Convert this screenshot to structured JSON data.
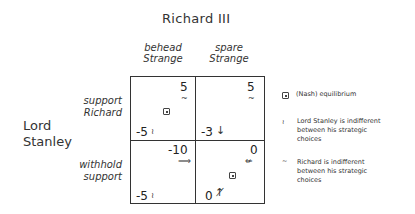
{
  "title": "Richard III",
  "column_player": "Richard III",
  "row_player": [
    "Lord",
    "Stanley"
  ],
  "columns": [
    {
      "line1": "behead",
      "line2": "Strange"
    },
    {
      "line1": "spare",
      "line2": "Strange"
    }
  ],
  "rows": [
    {
      "line1": "support",
      "line2": "Richard"
    },
    {
      "line1": "withhold",
      "line2": "support"
    }
  ],
  "cells": [
    [
      {
        "richard_payoff": "5",
        "richard_mark": "~",
        "stanley_payoff": "-5",
        "stanley_mark": "≀",
        "equilibrium": true
      },
      {
        "richard_payoff": "5",
        "richard_mark": "~",
        "stanley_payoff": "-3",
        "stanley_mark": "↓",
        "equilibrium": false
      }
    ],
    [
      {
        "richard_payoff": "-10",
        "richard_mark": "⟹",
        "stanley_payoff": "-5",
        "stanley_mark": "≀",
        "equilibrium": false
      },
      {
        "richard_payoff": "0",
        "richard_mark": "⇍",
        "stanley_payoff": "0",
        "stanley_mark": "↑̸",
        "equilibrium": true
      }
    ]
  ],
  "legend": [
    {
      "symbol": "⊡",
      "icon": "equilibrium-icon",
      "text": "(Nash) equilibrium"
    },
    {
      "symbol": "≀",
      "icon": "stanley-indifferent-icon",
      "lines": [
        "Lord Stanley is indifferent",
        "between his strategic",
        "choices"
      ]
    },
    {
      "symbol": "~",
      "icon": "richard-indifferent-icon",
      "lines": [
        "Richard is indifferent",
        "between his strategic",
        "choices"
      ]
    }
  ]
}
